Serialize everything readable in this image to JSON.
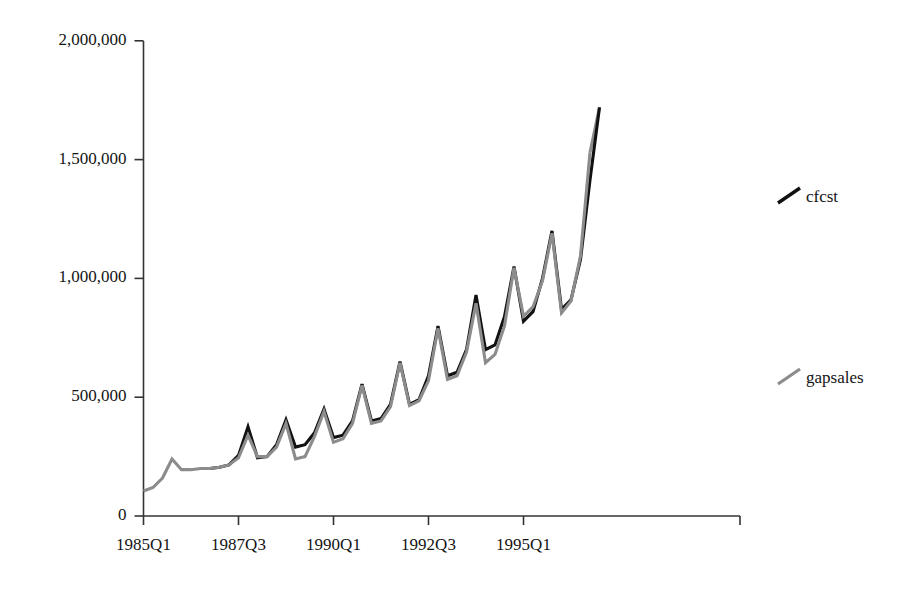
{
  "chart_data": {
    "type": "line",
    "title": "",
    "xlabel": "",
    "ylabel": "",
    "ylim": [
      0,
      2000000
    ],
    "grid": false,
    "legend_position": "right",
    "y_ticks": [
      {
        "value": 2000000,
        "label": "2,000,000"
      },
      {
        "value": 1500000,
        "label": "1,500,000"
      },
      {
        "value": 1000000,
        "label": "1,000,000"
      },
      {
        "value": 500000,
        "label": "500,000"
      },
      {
        "value": 0,
        "label": "0"
      }
    ],
    "x_ticks": [
      {
        "index": 0,
        "label": "1985Q1"
      },
      {
        "index": 10,
        "label": "1987Q3"
      },
      {
        "index": 20,
        "label": "1990Q1"
      },
      {
        "index": 30,
        "label": "1992Q3"
      },
      {
        "index": 40,
        "label": "1995Q1"
      }
    ],
    "x": [
      "1985Q1",
      "1985Q2",
      "1985Q3",
      "1985Q4",
      "1986Q1",
      "1986Q2",
      "1986Q3",
      "1986Q4",
      "1987Q1",
      "1987Q2",
      "1987Q3",
      "1987Q4",
      "1988Q1",
      "1988Q2",
      "1988Q3",
      "1988Q4",
      "1989Q1",
      "1989Q2",
      "1989Q3",
      "1989Q4",
      "1990Q1",
      "1990Q2",
      "1990Q3",
      "1990Q4",
      "1991Q1",
      "1991Q2",
      "1991Q3",
      "1991Q4",
      "1992Q1",
      "1992Q2",
      "1992Q3",
      "1992Q4",
      "1993Q1",
      "1993Q2",
      "1993Q3",
      "1993Q4",
      "1994Q1",
      "1994Q2",
      "1994Q3",
      "1994Q4",
      "1995Q1",
      "1995Q2",
      "1995Q3",
      "1995Q4",
      "1996Q1",
      "1996Q2",
      "1996Q3",
      "1996Q4"
    ],
    "series": [
      {
        "name": "cfcst",
        "color": "#111111",
        "width": 3.1,
        "start_index": 7,
        "values": [
          null,
          null,
          null,
          null,
          null,
          null,
          null,
          200000,
          205000,
          215000,
          255000,
          375000,
          245000,
          250000,
          300000,
          405000,
          290000,
          300000,
          350000,
          450000,
          330000,
          340000,
          400000,
          555000,
          400000,
          410000,
          470000,
          650000,
          470000,
          490000,
          590000,
          800000,
          590000,
          605000,
          700000,
          930000,
          700000,
          720000,
          840000,
          1050000,
          820000,
          860000,
          1000000,
          1200000,
          870000,
          910000,
          1080000,
          1415000
        ]
      },
      {
        "name": "gapsales",
        "color": "#8c8c8c",
        "width": 3.1,
        "start_index": 0,
        "values": [
          105000,
          120000,
          160000,
          240000,
          195000,
          195000,
          200000,
          200000,
          205000,
          215000,
          245000,
          340000,
          250000,
          250000,
          290000,
          390000,
          240000,
          250000,
          335000,
          440000,
          310000,
          325000,
          390000,
          550000,
          390000,
          400000,
          460000,
          645000,
          465000,
          485000,
          570000,
          790000,
          575000,
          590000,
          690000,
          895000,
          645000,
          680000,
          800000,
          1045000,
          840000,
          880000,
          990000,
          1190000,
          855000,
          905000,
          1095000,
          1530000
        ]
      },
      {
        "name": "cfcst-tail",
        "color": "#111111",
        "width": 3.1,
        "start_index": 47,
        "values": [
          null,
          null,
          null,
          null,
          null,
          null,
          null,
          null,
          null,
          null,
          null,
          null,
          null,
          null,
          null,
          null,
          null,
          null,
          null,
          null,
          null,
          null,
          null,
          null,
          null,
          null,
          null,
          null,
          null,
          null,
          null,
          null,
          null,
          null,
          null,
          null,
          null,
          null,
          null,
          null,
          null,
          null,
          null,
          null,
          null,
          null,
          null,
          1415000
        ]
      }
    ],
    "final_segment": {
      "from_index": 46,
      "from_value": 1080000,
      "to_index": 48,
      "to_value": 1720000,
      "note": "final rising segment to end of series"
    }
  },
  "legend": {
    "entries": [
      {
        "label": "cfcst",
        "color": "#111111"
      },
      {
        "label": "gapsales",
        "color": "#8c8c8c"
      }
    ]
  }
}
